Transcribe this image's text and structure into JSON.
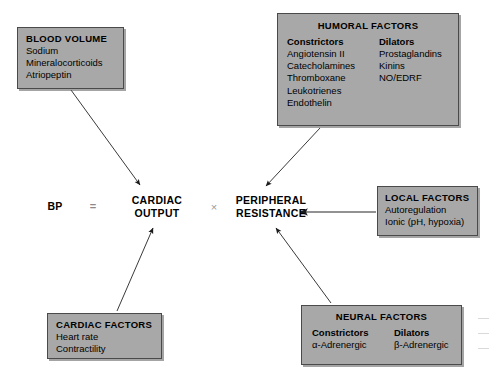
{
  "diagram": {
    "equation": {
      "bp_label": "BP",
      "equals_sign": "=",
      "cardiac_output_line1": "CARDIAC",
      "cardiac_output_line2": "OUTPUT",
      "times_sign": "×",
      "peripheral_resistance_line1": "PERIPHERAL",
      "peripheral_resistance_line2": "RESISTANCE"
    },
    "boxes": {
      "blood_volume": {
        "title": "BLOOD VOLUME",
        "items": [
          "Sodium",
          "Mineralocorticoids",
          "Atriopeptin"
        ]
      },
      "humoral_factors": {
        "title": "HUMORAL FACTORS",
        "constrictors_heading": "Constrictors",
        "constrictors": [
          "Angiotensin II",
          "Catecholamines",
          "Thromboxane",
          "Leukotrienes",
          "Endothelin"
        ],
        "dilators_heading": "Dilators",
        "dilators": [
          "Prostaglandins",
          "Kinins",
          "NO/EDRF"
        ]
      },
      "local_factors": {
        "title": "LOCAL FACTORS",
        "items": [
          "Autoregulation",
          "Ionic (pH, hypoxia)"
        ]
      },
      "cardiac_factors": {
        "title": "CARDIAC FACTORS",
        "items": [
          "Heart rate",
          "Contractility"
        ]
      },
      "neural_factors": {
        "title": "NEURAL FACTORS",
        "constrictors_heading": "Constrictors",
        "constrictors": [
          "α-Adrenergic"
        ],
        "dilators_heading": "Dilators",
        "dilators": [
          "β-Adrenergic"
        ]
      }
    },
    "arrows": [
      {
        "name": "blood-volume-to-cardiac-output",
        "from": "blood_volume",
        "to": "cardiac_output"
      },
      {
        "name": "humoral-factors-to-peripheral-resistance",
        "from": "humoral_factors",
        "to": "peripheral_resistance"
      },
      {
        "name": "cardiac-factors-to-cardiac-output",
        "from": "cardiac_factors",
        "to": "cardiac_output"
      },
      {
        "name": "neural-factors-to-peripheral-resistance",
        "from": "neural_factors",
        "to": "peripheral_resistance"
      },
      {
        "name": "local-factors-to-peripheral-resistance",
        "from": "local_factors",
        "to": "peripheral_resistance"
      }
    ],
    "colors": {
      "box_fill": "#a8a8a8",
      "box_border": "#4a4a4a",
      "background": "#ffffff",
      "text": "#000000",
      "arrow": "#1a1a1a",
      "operator": "#8a8a8a"
    }
  }
}
